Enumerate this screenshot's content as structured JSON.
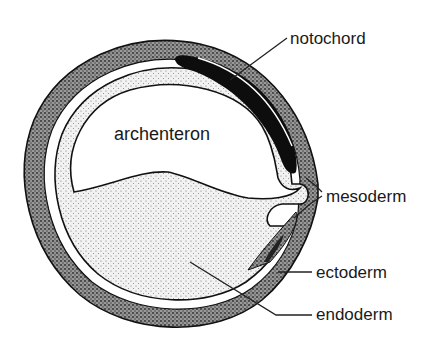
{
  "diagram": {
    "type": "biological cross-section",
    "labels": {
      "cavity": "archenteron",
      "notochord": "notochord",
      "mesoderm": "mesoderm",
      "ectoderm": "ectoderm",
      "endoderm": "endoderm"
    },
    "colors": {
      "background": "#ffffff",
      "ectoderm_fill": "#8a8a8a",
      "endoderm_fill": "#d9d9d9",
      "notochord_fill": "#0d0d0d",
      "cavity_fill": "#ffffff",
      "outline": "#111111"
    }
  }
}
